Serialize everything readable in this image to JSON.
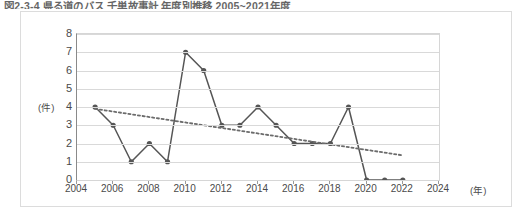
{
  "figure": {
    "title": "図2-3-4 県る道のバス 千単故事計 年度別推移 2005~2021年度"
  },
  "chart_data": {
    "type": "line",
    "title": "図2-3-4 県る道のバス 千単故事計 年度別推移 2005~2021年度",
    "xlabel": "(年)",
    "ylabel": "(件)",
    "xlim": [
      2004,
      2024
    ],
    "ylim": [
      0,
      8
    ],
    "grid": true,
    "legend": "none",
    "y_ticks": [
      0,
      1,
      2,
      3,
      4,
      5,
      6,
      7,
      8
    ],
    "x_ticks": [
      2004,
      2006,
      2008,
      2010,
      2012,
      2014,
      2016,
      2018,
      2020,
      2022,
      2024
    ],
    "series": [
      {
        "name": "件数",
        "style": "solid-marker",
        "color": "#555555",
        "x": [
          2005,
          2006,
          2007,
          2008,
          2009,
          2010,
          2011,
          2012,
          2013,
          2014,
          2015,
          2016,
          2017,
          2018,
          2019,
          2020,
          2021,
          2022
        ],
        "values": [
          4,
          3,
          1,
          2,
          1,
          7,
          6,
          3,
          3,
          4,
          3,
          2,
          2,
          2,
          4,
          0,
          0,
          0
        ]
      },
      {
        "name": "近似直線",
        "style": "dotted-trendline",
        "color": "#6b6b6b",
        "x": [
          2005,
          2022
        ],
        "values": [
          3.9,
          1.35
        ]
      }
    ]
  },
  "axis_units": {
    "y_unit": "(件)",
    "x_unit": "(年)"
  }
}
